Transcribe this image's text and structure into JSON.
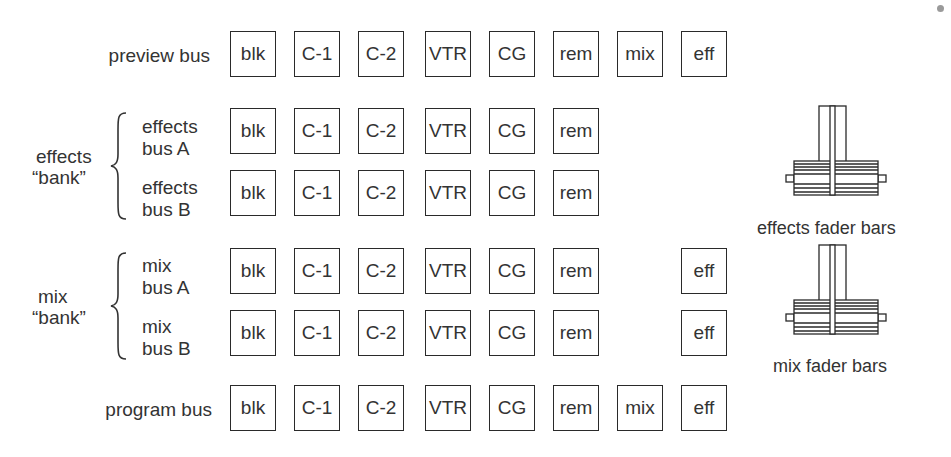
{
  "diagram": {
    "rows": [
      {
        "id": "preview",
        "label": "preview bus",
        "top": 31,
        "buttons": [
          {
            "label": "blk",
            "col": 0
          },
          {
            "label": "C-1",
            "col": 1
          },
          {
            "label": "C-2",
            "col": 2
          },
          {
            "label": "VTR",
            "col": 3
          },
          {
            "label": "CG",
            "col": 4
          },
          {
            "label": "rem",
            "col": 5
          },
          {
            "label": "mix",
            "col": 6
          },
          {
            "label": "eff",
            "col": 7
          }
        ]
      },
      {
        "id": "effects-a",
        "label_line1": "effects",
        "label_line2": "bus A",
        "top": 108,
        "buttons": [
          {
            "label": "blk",
            "col": 0
          },
          {
            "label": "C-1",
            "col": 1
          },
          {
            "label": "C-2",
            "col": 2
          },
          {
            "label": "VTR",
            "col": 3
          },
          {
            "label": "CG",
            "col": 4
          },
          {
            "label": "rem",
            "col": 5
          }
        ]
      },
      {
        "id": "effects-b",
        "label_line1": "effects",
        "label_line2": "bus B",
        "top": 170,
        "buttons": [
          {
            "label": "blk",
            "col": 0
          },
          {
            "label": "C-1",
            "col": 1
          },
          {
            "label": "C-2",
            "col": 2
          },
          {
            "label": "VTR",
            "col": 3
          },
          {
            "label": "CG",
            "col": 4
          },
          {
            "label": "rem",
            "col": 5
          }
        ]
      },
      {
        "id": "mix-a",
        "label_line1": "mix",
        "label_line2": "bus A",
        "top": 248,
        "buttons": [
          {
            "label": "blk",
            "col": 0
          },
          {
            "label": "C-1",
            "col": 1
          },
          {
            "label": "C-2",
            "col": 2
          },
          {
            "label": "VTR",
            "col": 3
          },
          {
            "label": "CG",
            "col": 4
          },
          {
            "label": "rem",
            "col": 5
          },
          {
            "label": "eff",
            "col": 7
          }
        ]
      },
      {
        "id": "mix-b",
        "label_line1": "mix",
        "label_line2": "bus B",
        "top": 310,
        "buttons": [
          {
            "label": "blk",
            "col": 0
          },
          {
            "label": "C-1",
            "col": 1
          },
          {
            "label": "C-2",
            "col": 2
          },
          {
            "label": "VTR",
            "col": 3
          },
          {
            "label": "CG",
            "col": 4
          },
          {
            "label": "rem",
            "col": 5
          },
          {
            "label": "eff",
            "col": 7
          }
        ]
      },
      {
        "id": "program",
        "label": "program bus",
        "top": 385,
        "buttons": [
          {
            "label": "blk",
            "col": 0
          },
          {
            "label": "C-1",
            "col": 1
          },
          {
            "label": "C-2",
            "col": 2
          },
          {
            "label": "VTR",
            "col": 3
          },
          {
            "label": "CG",
            "col": 4
          },
          {
            "label": "rem",
            "col": 5
          },
          {
            "label": "mix",
            "col": 6
          },
          {
            "label": "eff",
            "col": 7
          }
        ]
      }
    ],
    "banks": {
      "effects": {
        "line1": "effects",
        "line2": "“bank”"
      },
      "mix": {
        "line1": "mix",
        "line2": "“bank”"
      }
    },
    "faders": {
      "effects": {
        "label": "effects fader bars"
      },
      "mix": {
        "label": "mix fader bars"
      }
    }
  }
}
